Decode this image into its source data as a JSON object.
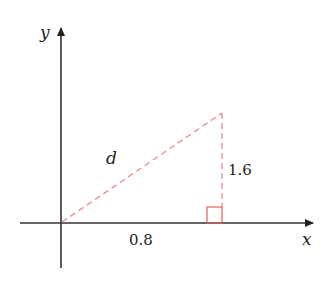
{
  "diagram": {
    "axes": {
      "x_label": "x",
      "y_label": "y"
    },
    "triangle": {
      "hypotenuse_label": "d",
      "vertical_leg_label": "1.6",
      "horizontal_leg_label": "0.8",
      "right_angle_marker": true
    },
    "colors": {
      "axis": "#333333",
      "dashed": "#e88a8a",
      "right_angle": "#e06060",
      "text": "#222222"
    }
  }
}
